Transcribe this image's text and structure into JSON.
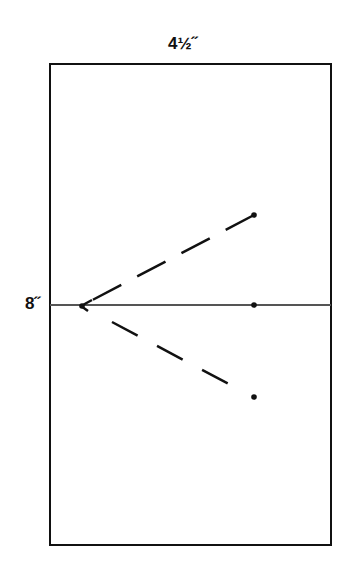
{
  "diagram": {
    "width_label": "4½˝",
    "height_label": "8˝",
    "colors": {
      "stroke": "#111111",
      "centerline": "#555555",
      "background": "#ffffff"
    },
    "rectangle": {
      "x": 50,
      "y": 64,
      "width": 281,
      "height": 481
    },
    "centerline_y": 305,
    "origin_point": {
      "x": 81,
      "y": 306
    },
    "target_points": [
      {
        "name": "top",
        "x": 254,
        "y": 215
      },
      {
        "name": "middle",
        "x": 254,
        "y": 305
      },
      {
        "name": "bottom",
        "x": 254,
        "y": 397
      }
    ]
  }
}
